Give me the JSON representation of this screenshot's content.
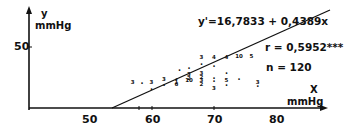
{
  "chart_data": {
    "type": "scatter",
    "title": "",
    "xlabel": "X",
    "xlabel_unit": "mmHg",
    "ylabel": "y",
    "ylabel_unit": "mmHg",
    "x_ticks": [
      50,
      60,
      70,
      80
    ],
    "y_ticks": [
      50
    ],
    "xlim": [
      40,
      87
    ],
    "ylim": [
      0,
      60
    ],
    "grid": false,
    "regression": {
      "equation": "y'=16,7833 + 0,4389x",
      "intercept": -16.7833,
      "slope": 0.4389
    },
    "stats": {
      "r_label": "r = 0,5952***",
      "n_label": "n = 120"
    },
    "points": [
      {
        "x": 57,
        "y": 20,
        "label": "3"
      },
      {
        "x": 58.5,
        "y": 20,
        "label": "."
      },
      {
        "x": 60,
        "y": 20,
        "label": "3"
      },
      {
        "x": 62,
        "y": 22,
        "label": "3"
      },
      {
        "x": 62,
        "y": 18,
        "label": "."
      },
      {
        "x": 64,
        "y": 23,
        "label": "."
      },
      {
        "x": 64,
        "y": 20,
        "label": "1"
      },
      {
        "x": 64,
        "y": 18,
        "label": "6"
      },
      {
        "x": 64.5,
        "y": 30,
        "label": "."
      },
      {
        "x": 66,
        "y": 26,
        "label": "3"
      },
      {
        "x": 66,
        "y": 23,
        "label": "2"
      },
      {
        "x": 66,
        "y": 21,
        "label": "10"
      },
      {
        "x": 66,
        "y": 32,
        "label": "."
      },
      {
        "x": 68,
        "y": 40,
        "label": "3"
      },
      {
        "x": 68,
        "y": 27,
        "label": "3"
      },
      {
        "x": 68,
        "y": 24,
        "label": "2"
      },
      {
        "x": 68,
        "y": 21,
        "label": "3"
      },
      {
        "x": 68,
        "y": 18,
        "label": "2"
      },
      {
        "x": 68,
        "y": 35,
        "label": "."
      },
      {
        "x": 70,
        "y": 40,
        "label": "4"
      },
      {
        "x": 70,
        "y": 34,
        "label": "."
      },
      {
        "x": 70,
        "y": 24,
        "label": "."
      },
      {
        "x": 70,
        "y": 21,
        "label": "."
      },
      {
        "x": 72,
        "y": 40,
        "label": "4"
      },
      {
        "x": 72,
        "y": 28,
        "label": "."
      },
      {
        "x": 72,
        "y": 21,
        "label": "5"
      },
      {
        "x": 72,
        "y": 18,
        "label": "."
      },
      {
        "x": 74,
        "y": 41,
        "label": "10"
      },
      {
        "x": 74,
        "y": 23,
        "label": "."
      },
      {
        "x": 76,
        "y": 41,
        "label": "5"
      },
      {
        "x": 77,
        "y": 20,
        "label": "3"
      },
      {
        "x": 77,
        "y": 17,
        "label": "."
      },
      {
        "x": 60,
        "y": 15,
        "label": "."
      },
      {
        "x": 70,
        "y": 15,
        "label": "3"
      }
    ]
  },
  "labels": {
    "y_axis_name": "y",
    "y_axis_unit": "mmHg",
    "y_tick_50": "50",
    "x_axis_name": "X",
    "x_axis_unit": "mmHg",
    "x_tick_50": "50",
    "x_tick_60": "60",
    "x_tick_70": "70",
    "x_tick_80": "80",
    "equation": "y'=16,7833 + 0,4389x",
    "r_value": "r = 0,5952***",
    "n_value": "n = 120"
  }
}
